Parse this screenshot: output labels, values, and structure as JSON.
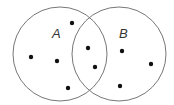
{
  "diagram": {
    "type": "venn",
    "sets": [
      {
        "label": "A",
        "cx": 60,
        "cy": 54,
        "r": 47,
        "label_x": 52,
        "label_y": 38
      },
      {
        "label": "B",
        "cx": 119,
        "cy": 54,
        "r": 47,
        "label_x": 119,
        "label_y": 38
      }
    ],
    "stroke_color": "#777777",
    "dot_color": "#111111",
    "points": [
      {
        "region": "A-only",
        "x": 72,
        "y": 23
      },
      {
        "region": "A-only",
        "x": 31,
        "y": 57
      },
      {
        "region": "A-only",
        "x": 57,
        "y": 61
      },
      {
        "region": "A-only",
        "x": 68,
        "y": 88
      },
      {
        "region": "A∩B",
        "x": 88,
        "y": 48
      },
      {
        "region": "A∩B",
        "x": 95,
        "y": 67
      },
      {
        "region": "B-only",
        "x": 122,
        "y": 51
      },
      {
        "region": "B-only",
        "x": 151,
        "y": 64
      },
      {
        "region": "B-only",
        "x": 120,
        "y": 86
      }
    ]
  }
}
